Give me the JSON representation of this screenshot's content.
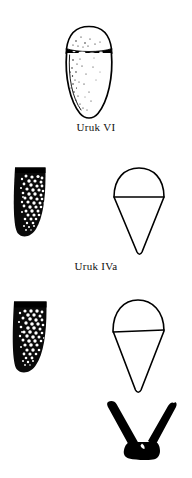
{
  "figure": {
    "background_color": "#ffffff",
    "ink_color": "#000000",
    "width": 192,
    "height": 478
  },
  "rows": [
    {
      "id": "row-uruk-vi",
      "label": "Uruk VI",
      "label_x": 0,
      "label_y": 122,
      "drawings": [
        {
          "id": "uruk-vi-complete-vessel",
          "name": "ovoid-vessel-drawing",
          "kind": "profile-outline-stippled",
          "description": "Complete ovoid vessel with domed top, dark rim band and stippled body",
          "x": 64,
          "y": 26,
          "width": 50,
          "height": 94
        }
      ]
    },
    {
      "id": "row-uruk-iva",
      "label": "Uruk IVa",
      "label_x": 0,
      "label_y": 261,
      "drawings": [
        {
          "id": "uruk-iva-sherd",
          "name": "vessel-sherd-drawing",
          "kind": "stippled-sherd",
          "description": "Wall sherd fragment with thick black rim and dense stipple",
          "x": 14,
          "y": 167,
          "width": 40,
          "height": 76
        },
        {
          "id": "uruk-iva-cone",
          "name": "conical-vessel-outline",
          "kind": "line-outline-cone",
          "description": "Conical cup outline with rounded top and horizontal rim line",
          "x": 110,
          "y": 167,
          "width": 58,
          "height": 86
        }
      ]
    },
    {
      "id": "row-unlabelled",
      "label": "",
      "label_x": 0,
      "label_y": 0,
      "drawings": [
        {
          "id": "lower-sherd",
          "name": "vessel-sherd-drawing",
          "kind": "stippled-sherd",
          "description": "Wall sherd fragment with thick black rim and dense stipple",
          "x": 12,
          "y": 300,
          "width": 42,
          "height": 76
        },
        {
          "id": "lower-cone",
          "name": "conical-vessel-outline",
          "kind": "line-outline-cone",
          "description": "Conical cup outline with rounded top and horizontal rim line",
          "x": 108,
          "y": 300,
          "width": 60,
          "height": 92
        },
        {
          "id": "lower-chevron-object",
          "name": "silhouette-artifact-drawing",
          "kind": "solid-black-silhouette",
          "description": "Solid black V-shaped artifact with flared arms and trapezoidal base",
          "x": 100,
          "y": 398,
          "width": 80,
          "height": 62
        }
      ]
    }
  ]
}
